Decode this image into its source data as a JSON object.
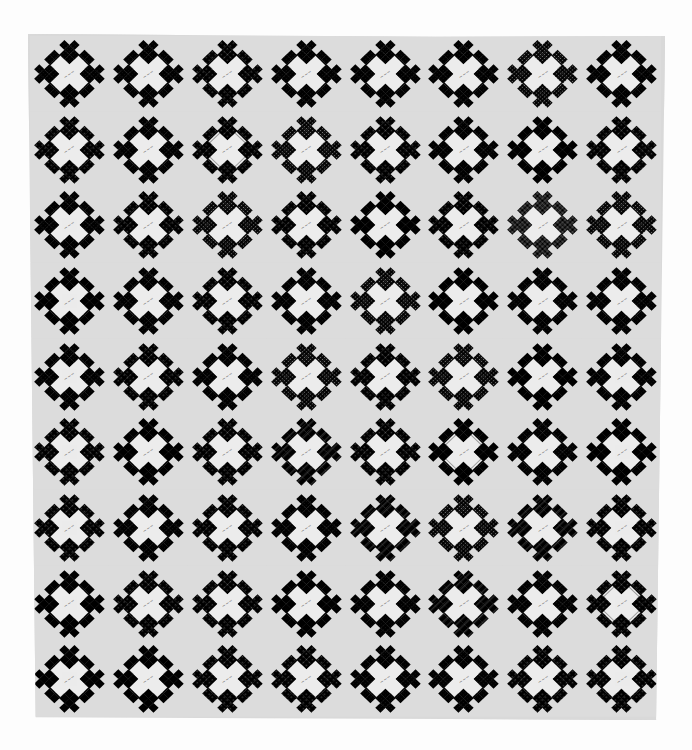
{
  "image": {
    "subject": "Black-and-white photograph of a signature album quilt",
    "layout": {
      "columns": 8,
      "rows": 9
    },
    "palette": {
      "background": "#fdfdfd",
      "sashing_light": "#dcdcdc",
      "cross_white": "#ececec",
      "tones": {
        "black": "#1e1e1e",
        "dark": "#3a3a3a",
        "mid_dark": "#555555",
        "mid": "#6e6e6e",
        "light": "#9a9a9a",
        "pale": "#b8b8b8"
      }
    },
    "blocks": [
      [
        {
          "tone": "mid_dark",
          "pattern": "print"
        },
        {
          "tone": "dark",
          "pattern": "print"
        },
        {
          "tone": "mid",
          "pattern": "floral"
        },
        {
          "tone": "mid",
          "pattern": "print"
        },
        {
          "tone": "dark",
          "pattern": "print"
        },
        {
          "tone": "mid",
          "pattern": "print"
        },
        {
          "tone": "black",
          "pattern": "dots"
        },
        {
          "tone": "mid",
          "pattern": "print"
        }
      ],
      [
        {
          "tone": "dark",
          "pattern": "floral"
        },
        {
          "tone": "black",
          "pattern": "print"
        },
        {
          "tone": "light",
          "pattern": "diamond"
        },
        {
          "tone": "black",
          "pattern": "dots"
        },
        {
          "tone": "dark",
          "pattern": "floral"
        },
        {
          "tone": "mid_dark",
          "pattern": "print"
        },
        {
          "tone": "mid_dark",
          "pattern": "solid"
        },
        {
          "tone": "mid_dark",
          "pattern": "floral"
        }
      ],
      [
        {
          "tone": "pale",
          "pattern": "print"
        },
        {
          "tone": "dark",
          "pattern": "floral"
        },
        {
          "tone": "mid",
          "pattern": "dots"
        },
        {
          "tone": "black",
          "pattern": "floral"
        },
        {
          "tone": "mid",
          "pattern": "solid"
        },
        {
          "tone": "mid_dark",
          "pattern": "floral"
        },
        {
          "tone": "black",
          "pattern": "rings"
        },
        {
          "tone": "black",
          "pattern": "dots"
        }
      ],
      [
        {
          "tone": "dark",
          "pattern": "stripes"
        },
        {
          "tone": "mid",
          "pattern": "print"
        },
        {
          "tone": "black",
          "pattern": "floral"
        },
        {
          "tone": "mid",
          "pattern": "print"
        },
        {
          "tone": "dark",
          "pattern": "dots"
        },
        {
          "tone": "mid_dark",
          "pattern": "solid"
        },
        {
          "tone": "mid_dark",
          "pattern": "print"
        },
        {
          "tone": "mid",
          "pattern": "print"
        }
      ],
      [
        {
          "tone": "mid_dark",
          "pattern": "print"
        },
        {
          "tone": "mid_dark",
          "pattern": "floral"
        },
        {
          "tone": "mid",
          "pattern": "print"
        },
        {
          "tone": "black",
          "pattern": "dots"
        },
        {
          "tone": "mid",
          "pattern": "floral"
        },
        {
          "tone": "black",
          "pattern": "dots"
        },
        {
          "tone": "light",
          "pattern": "solid"
        },
        {
          "tone": "mid_dark",
          "pattern": "print"
        }
      ],
      [
        {
          "tone": "black",
          "pattern": "floral"
        },
        {
          "tone": "mid",
          "pattern": "solid"
        },
        {
          "tone": "dark",
          "pattern": "floral"
        },
        {
          "tone": "light",
          "pattern": "plaid"
        },
        {
          "tone": "dark",
          "pattern": "floral"
        },
        {
          "tone": "light",
          "pattern": "stripe_diamond"
        },
        {
          "tone": "mid",
          "pattern": "print"
        },
        {
          "tone": "pale",
          "pattern": "stripes"
        }
      ],
      [
        {
          "tone": "light",
          "pattern": "floral"
        },
        {
          "tone": "mid_dark",
          "pattern": "print"
        },
        {
          "tone": "mid",
          "pattern": "floral"
        },
        {
          "tone": "dark",
          "pattern": "print"
        },
        {
          "tone": "light",
          "pattern": "plaid"
        },
        {
          "tone": "black",
          "pattern": "dots"
        },
        {
          "tone": "light",
          "pattern": "plaid"
        },
        {
          "tone": "dark",
          "pattern": "floral"
        }
      ],
      [
        {
          "tone": "black",
          "pattern": "lattice"
        },
        {
          "tone": "pale",
          "pattern": "floral"
        },
        {
          "tone": "black",
          "pattern": "floral"
        },
        {
          "tone": "light",
          "pattern": "solid"
        },
        {
          "tone": "black",
          "pattern": "print"
        },
        {
          "tone": "mid",
          "pattern": "plaid"
        },
        {
          "tone": "mid_dark",
          "pattern": "print"
        },
        {
          "tone": "mid",
          "pattern": "diamond"
        }
      ],
      [
        {
          "tone": "light",
          "pattern": "stripes"
        },
        {
          "tone": "mid_dark",
          "pattern": "solid"
        },
        {
          "tone": "pale",
          "pattern": "floral"
        },
        {
          "tone": "dark",
          "pattern": "floral"
        },
        {
          "tone": "light",
          "pattern": "print"
        },
        {
          "tone": "dark",
          "pattern": "print"
        },
        {
          "tone": "mid_dark",
          "pattern": "floral"
        },
        {
          "tone": "dark",
          "pattern": "floral"
        }
      ]
    ],
    "signature_text": "~~~"
  }
}
